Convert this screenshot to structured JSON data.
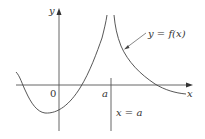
{
  "figure": {
    "type": "function-graph-with-vertical-asymptote",
    "colors": {
      "axis": "#555555",
      "curve": "#444444",
      "text": "#333333",
      "background": "#ffffff"
    },
    "axes": {
      "x_label": "x",
      "y_label": "y",
      "origin_label": "0"
    },
    "asymptote": {
      "tick_label": "a",
      "equation_label": "x = a"
    },
    "curve": {
      "label": "y = f(x)"
    }
  }
}
